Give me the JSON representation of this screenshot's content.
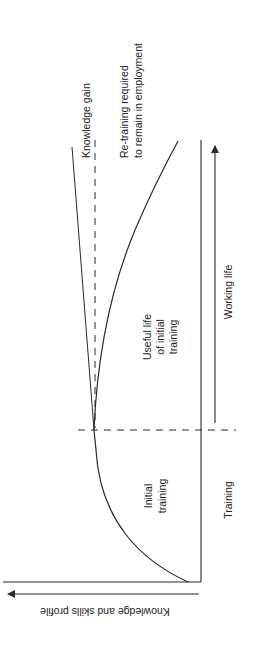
{
  "diagram": {
    "orientation": "rotated-90-ccw",
    "axes": {
      "vertical_axis_label": "Knowledge and skills profile",
      "time_axis": {
        "segments": [
          {
            "label": "Training"
          },
          {
            "label": "Working life"
          }
        ]
      }
    },
    "curves": {
      "knowledge_gain": {
        "label": "Knowledge gain"
      },
      "retraining": {
        "label_line1": "Re-training required",
        "label_line2": "to remain in employment"
      }
    },
    "regions": {
      "initial_training": {
        "line1": "Initial",
        "line2": "training"
      },
      "useful_life": {
        "line1": "Useful life",
        "line2": "of initial",
        "line3": "training"
      }
    },
    "colors": {
      "ink": "#2a2a2a",
      "background": "#ffffff"
    }
  }
}
